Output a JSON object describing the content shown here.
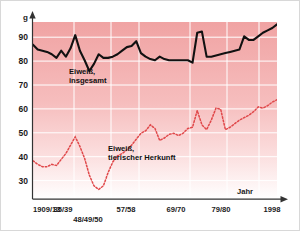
{
  "chart_data": {
    "type": "line",
    "title": "",
    "xlabel": "Jahr",
    "ylabel": "g",
    "ylim": [
      22,
      96
    ],
    "yticks": [
      30,
      40,
      50,
      60,
      70,
      80,
      90
    ],
    "ytick_labels": [
      "30",
      "40",
      "50",
      "60",
      "70",
      "80",
      "90"
    ],
    "unit_label": "g",
    "axis_name_x": "Jahr",
    "grid": true,
    "legend_position": "inline-annotations",
    "xtick_labels": [
      "1909/13",
      "35/39",
      "48/49/50",
      "57/58",
      "69/70",
      "79/80",
      "1998"
    ],
    "xtick_positions": [
      0,
      9,
      17,
      23,
      34,
      42,
      52
    ],
    "xtick_rows": [
      0,
      0,
      1,
      0,
      0,
      0,
      0
    ],
    "series": [
      {
        "name": "Eiweiß, insgesamt",
        "color": "#111111",
        "style": "solid",
        "label_lines": [
          "Eiweiß,",
          "insgesamt"
        ],
        "label_x": 12.0,
        "label_y": 75.5,
        "values": [
          86.5,
          84.5,
          84.0,
          83.5,
          82.5,
          81.0,
          84.0,
          81.5,
          85.0,
          90.5,
          84.0,
          80.0,
          75.5,
          78.5,
          82.5,
          81.0,
          81.0,
          81.5,
          82.5,
          84.0,
          85.5,
          86.0,
          88.0,
          83.0,
          81.5,
          80.5,
          80.0,
          81.5,
          80.5,
          80.0,
          80.0,
          80.0,
          80.0,
          80.0,
          79.0,
          91.5,
          92.0,
          81.5,
          81.5,
          82.0,
          82.5,
          83.0,
          83.5,
          84.0,
          84.5,
          90.0,
          88.5,
          88.5,
          90.0,
          91.5,
          92.5,
          93.5,
          95.0
        ]
      },
      {
        "name": "Eiweiß, tierischer Herkunft",
        "color": "#e0484a",
        "style": "dashed",
        "label_lines": [
          "Eiweiß,",
          "tierischer Herkunft"
        ],
        "label_x": 19.0,
        "label_y": 42.0,
        "values": [
          38.0,
          36.5,
          35.5,
          35.5,
          36.5,
          36.0,
          38.5,
          41.0,
          44.5,
          48.0,
          44.0,
          39.0,
          32.0,
          27.5,
          26.0,
          27.5,
          33.0,
          37.5,
          40.0,
          41.0,
          42.5,
          44.5,
          47.0,
          49.5,
          50.5,
          53.0,
          51.5,
          46.5,
          47.5,
          49.0,
          49.5,
          48.5,
          49.5,
          51.5,
          52.0,
          59.0,
          53.0,
          51.0,
          55.0,
          60.0,
          59.5,
          51.0,
          52.0,
          53.5,
          55.0,
          56.0,
          57.0,
          58.5,
          60.5,
          60.0,
          61.0,
          62.5,
          63.5
        ]
      }
    ]
  },
  "colors": {
    "plot_fill_top": "#f2a9a9",
    "plot_fill_bottom": "#ffffff",
    "grid": "#ffffff",
    "axis": "#333333",
    "series_total": "#111111",
    "series_animal": "#e0484a"
  }
}
